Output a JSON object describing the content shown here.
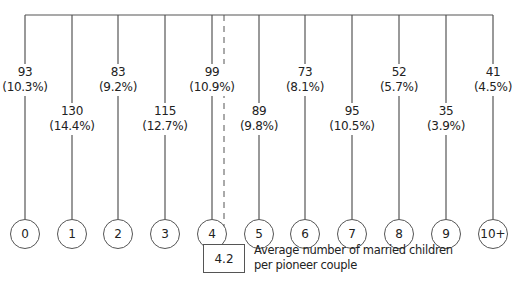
{
  "chart_data": {
    "type": "table",
    "title": "",
    "categories": [
      "0",
      "1",
      "2",
      "3",
      "4",
      "5",
      "6",
      "7",
      "8",
      "9",
      "10+"
    ],
    "counts": [
      93,
      130,
      83,
      115,
      99,
      89,
      73,
      95,
      52,
      35,
      41
    ],
    "percents": [
      "(10.3%)",
      "(14.4%)",
      "(9.2%)",
      "(12.7%)",
      "(10.9%)",
      "(9.8%)",
      "(8.1%)",
      "(10.5%)",
      "(5.7%)",
      "(3.9%)",
      "(4.5%)"
    ],
    "average": {
      "value": "4.2",
      "label_line1": "Average number of married children",
      "label_line2": "per pioneer couple"
    }
  },
  "nodes": [
    {
      "category": "0",
      "count": "93",
      "percent": "(10.3%)"
    },
    {
      "category": "1",
      "count": "130",
      "percent": "(14.4%)"
    },
    {
      "category": "2",
      "count": "83",
      "percent": "(9.2%)"
    },
    {
      "category": "3",
      "count": "115",
      "percent": "(12.7%)"
    },
    {
      "category": "4",
      "count": "99",
      "percent": "(10.9%)"
    },
    {
      "category": "5",
      "count": "89",
      "percent": "(9.8%)"
    },
    {
      "category": "6",
      "count": "73",
      "percent": "(8.1%)"
    },
    {
      "category": "7",
      "count": "95",
      "percent": "(10.5%)"
    },
    {
      "category": "8",
      "count": "52",
      "percent": "(5.7%)"
    },
    {
      "category": "9",
      "count": "35",
      "percent": "(3.9%)"
    },
    {
      "category": "10+",
      "count": "41",
      "percent": "(4.5%)"
    }
  ],
  "average": {
    "value": "4.2",
    "line1": "Average number of married children",
    "line2": "per pioneer couple"
  }
}
